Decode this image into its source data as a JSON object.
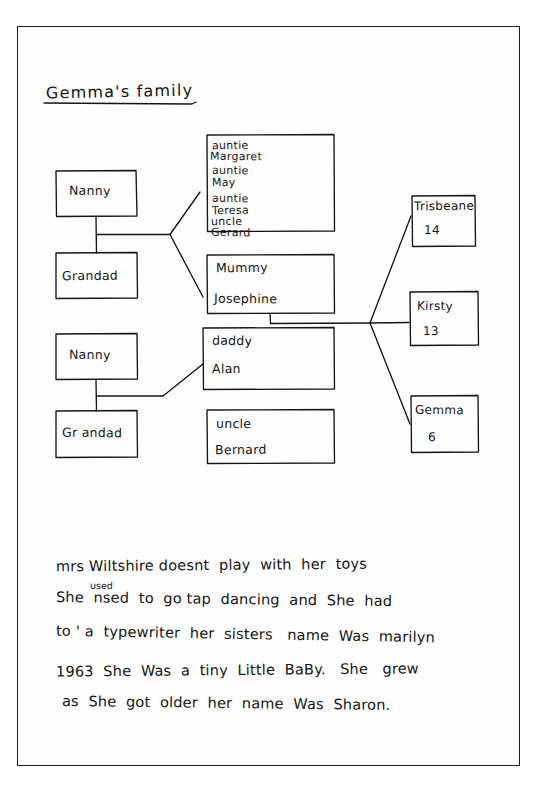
{
  "page": {
    "title": "Gemma's family",
    "background_color": "#ffffff",
    "ink_color": "#151515"
  },
  "family_tree": {
    "grandparents_top": [
      {
        "id": "nanny-1",
        "label": "Nanny"
      },
      {
        "id": "grandad-1",
        "label": "Grandad"
      }
    ],
    "grandparents_bottom": [
      {
        "id": "nanny-2",
        "label": "Nanny"
      },
      {
        "id": "grandad-2",
        "label": "Gr andad"
      }
    ],
    "aunts_uncles_box": {
      "id": "aunts-uncles",
      "lines": [
        "auntie",
        "Margaret",
        "auntie",
        "May",
        "auntie",
        "Teresa",
        "uncle",
        "Gerard"
      ]
    },
    "parents": [
      {
        "id": "mummy",
        "relation": "Mummy",
        "name": "Josephine"
      },
      {
        "id": "daddy",
        "relation": "daddy",
        "name": "Alan"
      }
    ],
    "uncle_box": {
      "id": "uncle-bernard",
      "relation": "uncle",
      "name": "Bernard"
    },
    "children": [
      {
        "id": "child-trisbeane",
        "name": "Trisbeane",
        "age": "14"
      },
      {
        "id": "child-kirsty",
        "name": "Kirsty",
        "age": "13"
      },
      {
        "id": "child-gemma",
        "name": "Gemma",
        "age": "6"
      }
    ]
  },
  "paragraph": {
    "lines": [
      "mrs Wiltshire doesnt  play  with  her  toys",
      "She  nsed  to  go tap  dancing  and  She  had",
      "to ' a  typewriter  her  sisters   name  Was  marilyn",
      "1963  She  Was  a  tiny  Little  BaBy.   She   grew",
      "as  She  got  older  her  name  Was  Sharon."
    ],
    "inserted_correction": "used"
  }
}
